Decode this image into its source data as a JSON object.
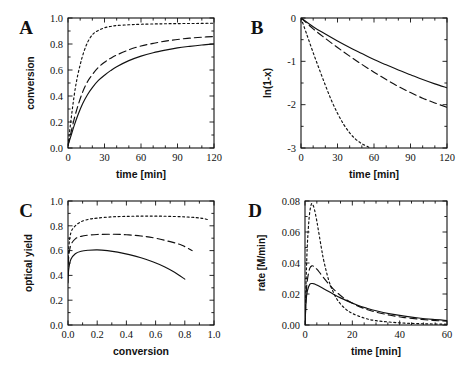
{
  "figure": {
    "background": "#ffffff",
    "ink": "#111111",
    "panel_letters": [
      "A",
      "B",
      "C",
      "D"
    ]
  },
  "chart_data": [
    {
      "id": "A",
      "type": "line",
      "panel_label": "A",
      "title": "",
      "xlabel": "time  [min]",
      "ylabel": "conversion",
      "xlim": [
        0,
        120
      ],
      "ylim": [
        0.0,
        1.0
      ],
      "xticks": [
        0,
        30,
        60,
        90,
        120
      ],
      "xticklabels": [
        "0",
        "30",
        "60",
        "90",
        "120"
      ],
      "yticks": [
        0.0,
        0.2,
        0.4,
        0.6,
        0.8,
        1.0
      ],
      "yticklabels": [
        "0.0",
        "0.2",
        "0.4",
        "0.6",
        "0.8",
        "1.0"
      ],
      "minor_xticks": [
        10,
        20,
        40,
        50,
        70,
        80,
        100,
        110
      ],
      "minor_yticks": [
        0.1,
        0.3,
        0.5,
        0.7,
        0.9
      ],
      "grid": false,
      "legend": "none",
      "series": [
        {
          "name": "dotted",
          "style": "dotted",
          "x": [
            0,
            2,
            4,
            6,
            8,
            10,
            12,
            15,
            18,
            21,
            25,
            30,
            35,
            40,
            50,
            60,
            75,
            90,
            105,
            120
          ],
          "values": [
            0.02,
            0.18,
            0.33,
            0.46,
            0.56,
            0.64,
            0.71,
            0.79,
            0.845,
            0.88,
            0.905,
            0.925,
            0.935,
            0.942,
            0.948,
            0.952,
            0.955,
            0.957,
            0.958,
            0.96
          ]
        },
        {
          "name": "dashed",
          "style": "dashed",
          "x": [
            0,
            2,
            5,
            8,
            12,
            16,
            20,
            25,
            30,
            35,
            40,
            50,
            60,
            70,
            80,
            90,
            100,
            110,
            120
          ],
          "values": [
            0.02,
            0.1,
            0.22,
            0.32,
            0.43,
            0.51,
            0.565,
            0.62,
            0.66,
            0.69,
            0.715,
            0.755,
            0.785,
            0.805,
            0.822,
            0.835,
            0.845,
            0.852,
            0.858
          ]
        },
        {
          "name": "solid",
          "style": "solid",
          "x": [
            0,
            2,
            5,
            8,
            12,
            16,
            20,
            25,
            30,
            35,
            40,
            50,
            60,
            70,
            80,
            90,
            100,
            110,
            120
          ],
          "values": [
            0.02,
            0.08,
            0.17,
            0.25,
            0.34,
            0.41,
            0.465,
            0.52,
            0.56,
            0.595,
            0.625,
            0.672,
            0.707,
            0.733,
            0.753,
            0.77,
            0.782,
            0.792,
            0.8
          ]
        }
      ]
    },
    {
      "id": "B",
      "type": "line",
      "panel_label": "B",
      "title": "",
      "xlabel": "time  [min]",
      "ylabel": "ln(1-x)",
      "xlim": [
        0,
        120
      ],
      "ylim": [
        -3,
        0
      ],
      "xticks": [
        0,
        30,
        60,
        90,
        120
      ],
      "xticklabels": [
        "0",
        "30",
        "60",
        "90",
        "120"
      ],
      "yticks": [
        -3,
        -2,
        -1,
        0
      ],
      "yticklabels": [
        "-3",
        "-2",
        "-1",
        "0"
      ],
      "minor_xticks": [
        10,
        20,
        40,
        50,
        70,
        80,
        100,
        110
      ],
      "minor_yticks": [
        -2.5,
        -1.5,
        -0.5
      ],
      "grid": false,
      "legend": "none",
      "series": [
        {
          "name": "dotted",
          "style": "dotted",
          "x": [
            0,
            5,
            10,
            15,
            20,
            25,
            30,
            35,
            40,
            45,
            50,
            55,
            57
          ],
          "values": [
            0,
            -0.4,
            -0.8,
            -1.18,
            -1.55,
            -1.9,
            -2.2,
            -2.45,
            -2.65,
            -2.8,
            -2.9,
            -2.97,
            -3.0
          ]
        },
        {
          "name": "dashed",
          "style": "dashed",
          "x": [
            0,
            10,
            20,
            30,
            40,
            50,
            60,
            70,
            80,
            90,
            100,
            110,
            120
          ],
          "values": [
            0,
            -0.25,
            -0.47,
            -0.68,
            -0.88,
            -1.07,
            -1.25,
            -1.42,
            -1.58,
            -1.72,
            -1.85,
            -1.96,
            -2.06
          ]
        },
        {
          "name": "solid",
          "style": "solid",
          "x": [
            0,
            10,
            20,
            30,
            40,
            50,
            60,
            70,
            80,
            90,
            100,
            110,
            120
          ],
          "values": [
            0,
            -0.2,
            -0.37,
            -0.53,
            -0.68,
            -0.82,
            -0.96,
            -1.08,
            -1.2,
            -1.31,
            -1.42,
            -1.52,
            -1.61
          ]
        }
      ]
    },
    {
      "id": "C",
      "type": "line",
      "panel_label": "C",
      "title": "",
      "xlabel": "conversion",
      "ylabel": "optical  yield",
      "xlim": [
        0.0,
        1.0
      ],
      "ylim": [
        0.0,
        1.0
      ],
      "xticks": [
        0.0,
        0.2,
        0.4,
        0.6,
        0.8,
        1.0
      ],
      "xticklabels": [
        "0.0",
        "0.2",
        "0.4",
        "0.6",
        "0.8",
        "1.0"
      ],
      "yticks": [
        0.0,
        0.2,
        0.4,
        0.6,
        0.8,
        1.0
      ],
      "yticklabels": [
        "0.0",
        "0.2",
        "0.4",
        "0.6",
        "0.8",
        "1.0"
      ],
      "minor_xticks": [
        0.1,
        0.3,
        0.5,
        0.7,
        0.9
      ],
      "minor_yticks": [
        0.1,
        0.3,
        0.5,
        0.7,
        0.9
      ],
      "grid": false,
      "legend": "none",
      "series": [
        {
          "name": "dotted",
          "style": "dotted",
          "x": [
            0.0,
            0.005,
            0.02,
            0.05,
            0.09,
            0.14,
            0.2,
            0.3,
            0.4,
            0.5,
            0.6,
            0.7,
            0.8,
            0.88,
            0.93,
            0.97
          ],
          "values": [
            0.43,
            0.62,
            0.745,
            0.8,
            0.833,
            0.852,
            0.862,
            0.872,
            0.876,
            0.878,
            0.878,
            0.876,
            0.872,
            0.866,
            0.858,
            0.845
          ]
        },
        {
          "name": "dashed",
          "style": "dashed",
          "x": [
            0.0,
            0.005,
            0.02,
            0.05,
            0.09,
            0.14,
            0.2,
            0.3,
            0.4,
            0.5,
            0.6,
            0.7,
            0.78,
            0.85
          ],
          "values": [
            0.4,
            0.55,
            0.645,
            0.695,
            0.715,
            0.725,
            0.73,
            0.732,
            0.728,
            0.718,
            0.7,
            0.672,
            0.643,
            0.6
          ]
        },
        {
          "name": "solid",
          "style": "solid",
          "x": [
            0.0,
            0.005,
            0.02,
            0.05,
            0.09,
            0.14,
            0.2,
            0.27,
            0.34,
            0.42,
            0.5,
            0.58,
            0.66,
            0.73,
            0.8
          ],
          "values": [
            0.34,
            0.45,
            0.53,
            0.575,
            0.595,
            0.603,
            0.606,
            0.6,
            0.588,
            0.568,
            0.542,
            0.51,
            0.47,
            0.425,
            0.37
          ]
        }
      ]
    },
    {
      "id": "D",
      "type": "line",
      "panel_label": "D",
      "title": "",
      "xlabel": "time  [min]",
      "ylabel": "rate  [M/min]",
      "xlim": [
        0,
        60
      ],
      "ylim": [
        0.0,
        0.08
      ],
      "xticks": [
        0,
        20,
        40,
        60
      ],
      "xticklabels": [
        "0",
        "20",
        "40",
        "60"
      ],
      "yticks": [
        0.0,
        0.02,
        0.04,
        0.06,
        0.08
      ],
      "yticklabels": [
        "0.00",
        "0.02",
        "0.04",
        "0.06",
        "0.08"
      ],
      "minor_xticks": [
        5,
        10,
        15,
        25,
        30,
        35,
        45,
        50,
        55
      ],
      "minor_yticks": [
        0.01,
        0.03,
        0.05,
        0.07
      ],
      "grid": false,
      "legend": "none",
      "series": [
        {
          "name": "dotted",
          "style": "dotted",
          "x": [
            0,
            0.5,
            1,
            1.8,
            2.6,
            3.2,
            4,
            5,
            6,
            7,
            8,
            10,
            12,
            14,
            17,
            20,
            25,
            30,
            40,
            50,
            60
          ],
          "values": [
            0.0,
            0.03,
            0.052,
            0.07,
            0.0775,
            0.0778,
            0.0745,
            0.067,
            0.058,
            0.049,
            0.041,
            0.029,
            0.021,
            0.0155,
            0.0105,
            0.0075,
            0.0045,
            0.0028,
            0.0014,
            0.0008,
            0.0005
          ]
        },
        {
          "name": "dashed",
          "style": "dashed",
          "x": [
            0,
            0.5,
            1,
            2,
            3,
            4,
            5,
            6,
            8,
            10,
            12,
            15,
            18,
            22,
            26,
            30,
            36,
            42,
            48,
            54,
            60
          ],
          "values": [
            0.0,
            0.02,
            0.029,
            0.0365,
            0.0382,
            0.0375,
            0.036,
            0.0342,
            0.0302,
            0.0265,
            0.0232,
            0.019,
            0.0158,
            0.0125,
            0.0101,
            0.0083,
            0.0063,
            0.0048,
            0.0038,
            0.003,
            0.0024
          ]
        },
        {
          "name": "solid",
          "style": "solid",
          "x": [
            0,
            0.5,
            1,
            2,
            3,
            4,
            5,
            7,
            9,
            12,
            15,
            18,
            22,
            26,
            30,
            36,
            42,
            48,
            54,
            60
          ],
          "values": [
            0.0,
            0.016,
            0.022,
            0.0262,
            0.0268,
            0.0265,
            0.0258,
            0.0242,
            0.0225,
            0.0199,
            0.0175,
            0.0154,
            0.0129,
            0.0109,
            0.0092,
            0.0072,
            0.0057,
            0.0045,
            0.0036,
            0.0029
          ]
        }
      ]
    }
  ]
}
